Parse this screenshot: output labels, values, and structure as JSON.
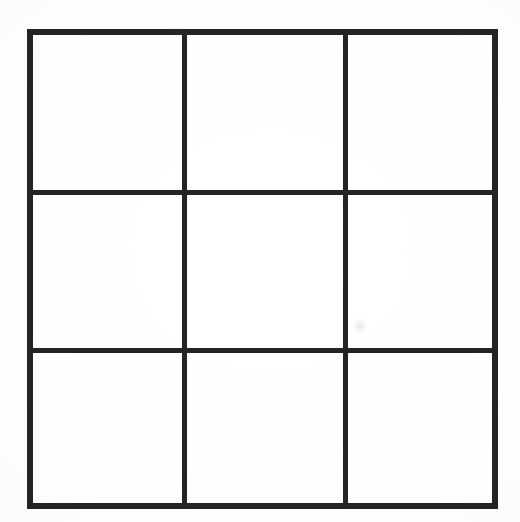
{
  "figure": {
    "medium": "scanned line drawing",
    "background_color": "#ffffff",
    "line_color": "#242424"
  },
  "grid": {
    "rows": 3,
    "columns": 3,
    "cell_count": 9,
    "outer_border": {
      "left": 27,
      "top": 29,
      "width": 471,
      "height": 480,
      "stroke_width": 6
    },
    "interior_lines": {
      "stroke_width": 5,
      "vertical_x": [
        182,
        343
      ],
      "horizontal_y": [
        190,
        348
      ]
    },
    "column_widths": [
      155,
      161,
      155
    ],
    "row_heights": [
      161,
      158,
      161
    ],
    "cells": [
      {
        "id": "cell-r1c1",
        "row": 1,
        "column": 1,
        "label": ""
      },
      {
        "id": "cell-r1c2",
        "row": 1,
        "column": 2,
        "label": ""
      },
      {
        "id": "cell-r1c3",
        "row": 1,
        "column": 3,
        "label": ""
      },
      {
        "id": "cell-r2c1",
        "row": 2,
        "column": 1,
        "label": ""
      },
      {
        "id": "cell-r2c2",
        "row": 2,
        "column": 2,
        "label": ""
      },
      {
        "id": "cell-r2c3",
        "row": 2,
        "column": 3,
        "label": ""
      },
      {
        "id": "cell-r3c1",
        "row": 3,
        "column": 1,
        "label": ""
      },
      {
        "id": "cell-r3c2",
        "row": 3,
        "column": 2,
        "label": ""
      },
      {
        "id": "cell-r3c3",
        "row": 3,
        "column": 3,
        "label": ""
      }
    ]
  },
  "artifacts": {
    "smudge": {
      "x": 352,
      "y": 318,
      "note": "faint gray scan smudge inside middle-right cell"
    }
  }
}
